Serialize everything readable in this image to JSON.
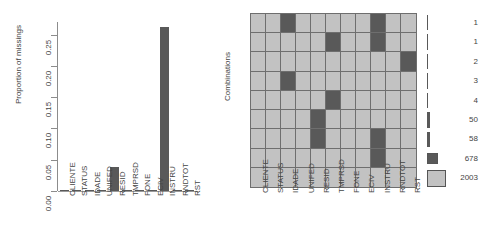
{
  "chart_data": [
    {
      "type": "bar",
      "title": "",
      "ylabel": "Proportion of missings",
      "xlabel": "",
      "categories": [
        "CLIENTE",
        "STATUS",
        "IDADE",
        "UNIFED",
        "RESID",
        "TMPRSD",
        "FONE",
        "ECIV",
        "INSTRU",
        "RNDTOT",
        "RST"
      ],
      "values": [
        0.0,
        0.0004,
        0.0019,
        0.0,
        0.0382,
        0.0019,
        0.0,
        0.0004,
        0.262,
        0.0004,
        0.0011
      ],
      "ylim": [
        0.0,
        0.27
      ],
      "ytick_labels": [
        "0.00",
        "0.05",
        "0.10",
        "0.15",
        "0.20",
        "0.25"
      ],
      "ytick_values": [
        0.0,
        0.05,
        0.1,
        0.15,
        0.2,
        0.25
      ],
      "grid": false,
      "legend": "none",
      "bar_color": "#595959"
    },
    {
      "type": "heatmap",
      "title": "",
      "ylabel": "Combinations",
      "xlabel": "",
      "columns": [
        "CLIENTE",
        "STATUS",
        "IDADE",
        "UNIFED",
        "RESID",
        "TMPRSD",
        "FONE",
        "ECIV",
        "INSTRU",
        "RNDTOT",
        "RST"
      ],
      "row_counts": [
        1,
        1,
        2,
        3,
        4,
        50,
        58,
        678,
        2003
      ],
      "legend_position": "right",
      "observed_color": "#c2c2c2",
      "missing_color": "#595959",
      "cells": [
        [
          0,
          0,
          1,
          0,
          0,
          0,
          0,
          0,
          1,
          0,
          0
        ],
        [
          0,
          0,
          0,
          0,
          0,
          1,
          0,
          0,
          1,
          0,
          0
        ],
        [
          0,
          0,
          0,
          0,
          0,
          0,
          0,
          0,
          0,
          0,
          1
        ],
        [
          0,
          0,
          1,
          0,
          0,
          0,
          0,
          0,
          0,
          0,
          0
        ],
        [
          0,
          0,
          0,
          0,
          0,
          1,
          0,
          0,
          0,
          0,
          0
        ],
        [
          0,
          0,
          0,
          0,
          1,
          0,
          0,
          0,
          0,
          0,
          0
        ],
        [
          0,
          0,
          0,
          0,
          1,
          0,
          0,
          0,
          1,
          0,
          0
        ],
        [
          0,
          0,
          0,
          0,
          0,
          0,
          0,
          0,
          1,
          0,
          0
        ],
        [
          0,
          0,
          0,
          0,
          0,
          0,
          0,
          0,
          0,
          0,
          0
        ]
      ]
    }
  ]
}
